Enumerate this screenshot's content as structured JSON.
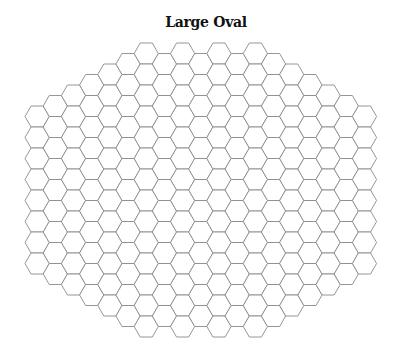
{
  "title": "Large Oval",
  "grid": {
    "orientation": "flat-top",
    "hex_height": 21,
    "left_edge_x": 25,
    "column_tops": [
      106,
      95.5,
      85,
      74.5,
      64,
      53.5,
      43,
      53.5,
      43,
      53.5,
      43,
      53.5,
      43,
      53.5,
      64,
      74.5,
      85,
      95.5,
      106
    ],
    "column_counts": [
      8,
      9,
      10,
      11,
      12,
      13,
      14,
      13,
      14,
      13,
      14,
      13,
      14,
      13,
      12,
      11,
      10,
      9,
      8
    ],
    "stroke_color": "#8a8a8a",
    "stroke_width": 0.9,
    "fill_color": "#ffffff"
  }
}
